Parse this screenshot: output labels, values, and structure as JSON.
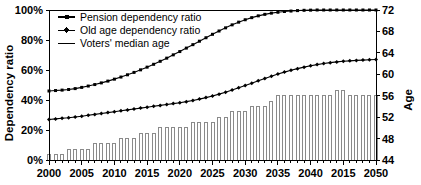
{
  "chart_data": {
    "type": "bar",
    "title": "",
    "subtitle": "",
    "xlabel": "",
    "ylabel": "Dependency ratio",
    "y2label": "Age",
    "grid": false,
    "legend_position": "top-left",
    "x": [
      2000,
      2001,
      2002,
      2003,
      2004,
      2005,
      2006,
      2007,
      2008,
      2009,
      2010,
      2011,
      2012,
      2013,
      2014,
      2015,
      2016,
      2017,
      2018,
      2019,
      2020,
      2021,
      2022,
      2023,
      2024,
      2025,
      2026,
      2027,
      2028,
      2029,
      2030,
      2031,
      2032,
      2033,
      2034,
      2035,
      2036,
      2037,
      2038,
      2039,
      2040,
      2041,
      2042,
      2043,
      2044,
      2045,
      2046,
      2047,
      2048,
      2049,
      2050
    ],
    "xlim": [
      2000,
      2050
    ],
    "xticklabels": [
      "2000",
      "2005",
      "2010",
      "2015",
      "2020",
      "2025",
      "2030",
      "2035",
      "2040",
      "2015",
      "2050"
    ],
    "xtickvalues": [
      2000,
      2005,
      2010,
      2015,
      2020,
      2025,
      2030,
      2035,
      2040,
      2045,
      2050
    ],
    "ylim": [
      0,
      100
    ],
    "yticklabels": [
      "0%",
      "20%",
      "40%",
      "60%",
      "80%",
      "100%"
    ],
    "ytickvalues": [
      0,
      20,
      40,
      60,
      80,
      100
    ],
    "y2lim": [
      44,
      72
    ],
    "y2ticklabels": [
      "44",
      "48",
      "52",
      "56",
      "60",
      "64",
      "68",
      "72"
    ],
    "y2tickvalues": [
      44,
      48,
      52,
      56,
      60,
      64,
      68,
      72
    ],
    "series": [
      {
        "name": "Pension dependency ratio",
        "type": "line",
        "axis": "left",
        "marker": "square",
        "values": [
          46.0,
          46.3,
          46.6,
          47.0,
          47.6,
          48.4,
          49.3,
          50.3,
          51.4,
          52.6,
          53.9,
          55.3,
          56.8,
          58.4,
          60.1,
          61.9,
          63.8,
          65.8,
          67.9,
          70.1,
          72.3,
          74.6,
          76.9,
          79.2,
          81.5,
          83.8,
          86.0,
          88.1,
          90.1,
          91.9,
          93.5,
          94.9,
          96.1,
          97.1,
          97.9,
          98.5,
          99.0,
          99.3,
          99.6,
          99.8,
          99.9,
          100.0,
          100.0,
          100.0,
          100.0,
          100.0,
          100.0,
          100.0,
          100.0,
          100.0,
          100.0
        ]
      },
      {
        "name": "Old age dependency ratio",
        "type": "line",
        "axis": "left",
        "marker": "diamond",
        "values": [
          27.0,
          27.4,
          27.8,
          28.2,
          28.7,
          29.2,
          29.8,
          30.4,
          31.0,
          31.6,
          32.2,
          32.8,
          33.4,
          34.0,
          34.6,
          35.2,
          35.8,
          36.4,
          37.0,
          37.6,
          38.2,
          38.9,
          39.7,
          40.6,
          41.6,
          42.7,
          43.9,
          45.2,
          46.6,
          48.1,
          49.6,
          51.2,
          52.8,
          54.4,
          55.9,
          57.3,
          58.6,
          59.8,
          60.9,
          61.9,
          62.8,
          63.6,
          64.3,
          64.9,
          65.4,
          65.8,
          66.1,
          66.4,
          66.6,
          66.8,
          67.0
        ]
      },
      {
        "name": "Voters' median age",
        "type": "bar",
        "axis": "right",
        "values": [
          45.0,
          45.0,
          45.0,
          46.0,
          46.0,
          46.0,
          46.0,
          47.0,
          47.0,
          47.0,
          47.0,
          48.0,
          48.0,
          48.0,
          49.0,
          49.0,
          49.0,
          50.0,
          50.0,
          50.0,
          50.0,
          50.0,
          51.0,
          51.0,
          51.0,
          51.0,
          52.0,
          52.0,
          53.0,
          53.0,
          53.0,
          54.0,
          54.0,
          54.0,
          55.0,
          56.0,
          56.0,
          56.0,
          56.0,
          56.0,
          56.0,
          56.0,
          56.0,
          56.0,
          57.0,
          57.0,
          56.0,
          56.0,
          56.0,
          56.0,
          56.0
        ]
      }
    ],
    "legend": [
      {
        "label": "Pension dependency ratio",
        "marker": "line-square"
      },
      {
        "label": "Old age dependency ratio",
        "marker": "line-diamond"
      },
      {
        "label": "Voters' median age",
        "marker": "line-plain"
      }
    ]
  }
}
